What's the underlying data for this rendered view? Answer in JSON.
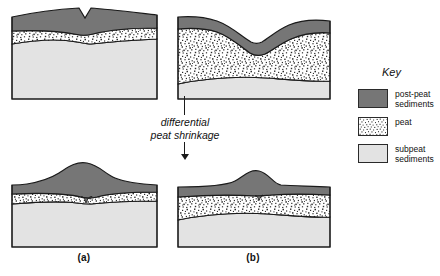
{
  "figure": {
    "title_text": "",
    "background": "#ffffff",
    "panels": [
      {
        "id": "panel-a-before",
        "label": "",
        "position": "top-left",
        "state": "before shrinkage",
        "layers": [
          "post-peat sediments",
          "peat",
          "subpeat sediments"
        ]
      },
      {
        "id": "panel-b-before",
        "label": "",
        "position": "top-right",
        "state": "before shrinkage",
        "layers": [
          "post-peat sediments",
          "peat",
          "subpeat sediments"
        ]
      },
      {
        "id": "panel-a-after",
        "label": "(a)",
        "position": "bottom-left",
        "state": "after shrinkage",
        "layers": [
          "post-peat sediments",
          "peat",
          "subpeat sediments"
        ]
      },
      {
        "id": "panel-b-after",
        "label": "(b)",
        "position": "bottom-right",
        "state": "after shrinkage",
        "layers": [
          "post-peat sediments",
          "peat",
          "subpeat sediments"
        ]
      }
    ],
    "panel_labels": {
      "a": "(a)",
      "b": "(b)"
    },
    "process_arrow": {
      "caption": "differential\npeat  shrinkage",
      "direction": "down",
      "icon": "down-arrow-icon"
    }
  },
  "legend": {
    "title": "Key",
    "items": [
      {
        "label": "post-peat\nsediments",
        "pattern": "solid-dark-gray",
        "color": "#767676",
        "swatch_icon": "legend-swatch-postpeat"
      },
      {
        "label": "peat",
        "pattern": "stipple-speckle",
        "color": "#ffffff",
        "swatch_icon": "legend-swatch-peat"
      },
      {
        "label": "subpeat\nsediments",
        "pattern": "solid-light-gray",
        "color": "#e3e3e3",
        "swatch_icon": "legend-swatch-subpeat"
      }
    ]
  },
  "colors": {
    "post_peat": "#767676",
    "peat_fill": "#ffffff",
    "peat_speckle": "#2b2b2b",
    "subpeat": "#e3e3e3",
    "outline": "#1a1a1a",
    "background": "#ffffff"
  }
}
